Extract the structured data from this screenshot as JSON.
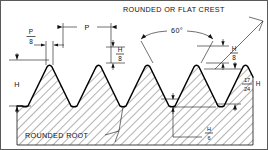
{
  "figure": {
    "type": "engineering-diagram",
    "width": 268,
    "height": 150,
    "background_color": "#ffffff",
    "line_color": "#111111",
    "border_color": "#5a5a5a"
  },
  "annotations": {
    "crest_note": "ROUNDED OR FLAT CREST",
    "root_note": "ROUNDED ROOT",
    "angle": "60°"
  },
  "dimensions": {
    "pitch": {
      "label": "P",
      "description": "thread pitch, crest to crest"
    },
    "pitch_eighth": {
      "numerator": "P",
      "denominator": "8",
      "label": "P/8"
    },
    "height_left": {
      "label": "H",
      "description": "full thread triangle height"
    },
    "height_eighth": {
      "numerator": "H",
      "denominator": "8",
      "label": "H/8"
    },
    "height_seventeen_twentyfourths": {
      "numerator": "17",
      "denominator": "24",
      "suffix": "H",
      "label": "17/24 H"
    },
    "height_sixth": {
      "numerator": "H",
      "denominator": "6",
      "label": "H/6"
    }
  }
}
